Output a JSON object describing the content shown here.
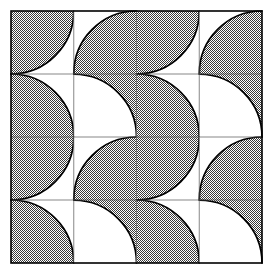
{
  "figure": {
    "type": "geometric-tiling",
    "background_color": "#ffffff",
    "fill_color": "#808080",
    "stroke_color": "#000000",
    "grid_line_color": "#555555",
    "border_color": "#000000"
  },
  "geometry": {
    "image_width": 275,
    "image_height": 274,
    "origin_x": 11,
    "origin_y": 11,
    "tile_width": 62.75,
    "tile_height": 63.0,
    "columns": 4,
    "rows": 4,
    "arc_radius_ratio": 1.0,
    "border_stroke_width": 1.6,
    "grid_stroke_width": 0.7,
    "arc_stroke_width": 1.7,
    "halftone_dot_size": 2,
    "halftone_dot_radius": 0.62
  },
  "tiles": [
    {
      "row": 0,
      "col": 0,
      "variant": "A",
      "shaded_corner": "top-left",
      "arc_center": "bottom-right"
    },
    {
      "row": 0,
      "col": 1,
      "variant": "B",
      "shaded_corner": "bottom-right",
      "arc_center": "top-left"
    },
    {
      "row": 0,
      "col": 2,
      "variant": "A",
      "shaded_corner": "top-left",
      "arc_center": "bottom-right"
    },
    {
      "row": 0,
      "col": 3,
      "variant": "B",
      "shaded_corner": "bottom-right",
      "arc_center": "top-left"
    },
    {
      "row": 1,
      "col": 0,
      "variant": "C",
      "shaded_corner": "bottom-left",
      "arc_center": "top-right"
    },
    {
      "row": 1,
      "col": 1,
      "variant": "D",
      "shaded_corner": "top-right",
      "arc_center": "bottom-left"
    },
    {
      "row": 1,
      "col": 2,
      "variant": "C",
      "shaded_corner": "bottom-left",
      "arc_center": "top-right"
    },
    {
      "row": 1,
      "col": 3,
      "variant": "D",
      "shaded_corner": "top-right",
      "arc_center": "bottom-left"
    },
    {
      "row": 2,
      "col": 0,
      "variant": "A",
      "shaded_corner": "top-left",
      "arc_center": "bottom-right"
    },
    {
      "row": 2,
      "col": 1,
      "variant": "B",
      "shaded_corner": "bottom-right",
      "arc_center": "top-left"
    },
    {
      "row": 2,
      "col": 2,
      "variant": "A",
      "shaded_corner": "top-left",
      "arc_center": "bottom-right"
    },
    {
      "row": 2,
      "col": 3,
      "variant": "B",
      "shaded_corner": "bottom-right",
      "arc_center": "top-left"
    },
    {
      "row": 3,
      "col": 0,
      "variant": "C",
      "shaded_corner": "bottom-left",
      "arc_center": "top-right"
    },
    {
      "row": 3,
      "col": 1,
      "variant": "D",
      "shaded_corner": "top-right",
      "arc_center": "bottom-left"
    },
    {
      "row": 3,
      "col": 2,
      "variant": "C",
      "shaded_corner": "bottom-left",
      "arc_center": "top-right"
    },
    {
      "row": 3,
      "col": 3,
      "variant": "D",
      "shaded_corner": "top-right",
      "arc_center": "bottom-left"
    }
  ]
}
